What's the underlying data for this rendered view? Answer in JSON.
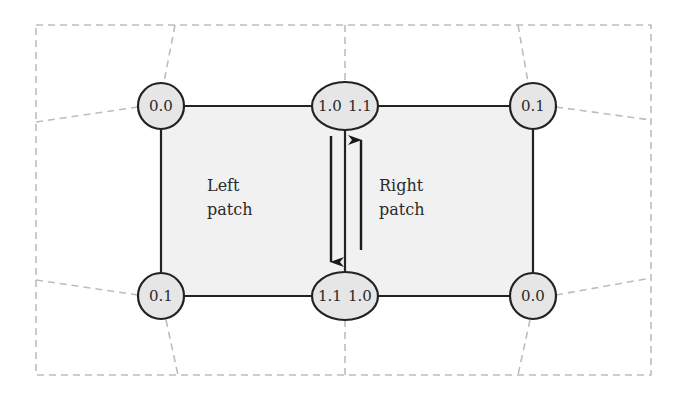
{
  "diagram": {
    "colors": {
      "background": "#ffffff",
      "patch_fill": "#f1f1f1",
      "node_fill": "#e6e6e6",
      "stroke": "#222222",
      "dashed_grid": "#bdbdbd"
    },
    "patches": {
      "left": {
        "line1": "Left",
        "line2": "patch"
      },
      "right": {
        "line1": "Right",
        "line2": "patch"
      }
    },
    "nodes": {
      "top_left": "0.0",
      "top_middle_left": "1.0",
      "top_middle_right": "1.1",
      "top_right": "0.1",
      "bottom_left": "0.1",
      "bottom_middle_left": "1.1",
      "bottom_middle_right": "1.0",
      "bottom_right": "0.0"
    },
    "arrows": {
      "left_edge": "down",
      "right_edge": "up"
    }
  }
}
